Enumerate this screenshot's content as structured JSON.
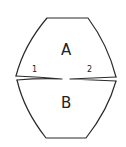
{
  "diagram": {
    "regions": [
      {
        "id": "upper",
        "label": "A"
      },
      {
        "id": "lower",
        "label": "B"
      }
    ],
    "points": [
      {
        "id": "left",
        "label": "1"
      },
      {
        "id": "right",
        "label": "2"
      }
    ],
    "colors": {
      "stroke": "#2a2a2a",
      "background": "#ffffff"
    }
  }
}
